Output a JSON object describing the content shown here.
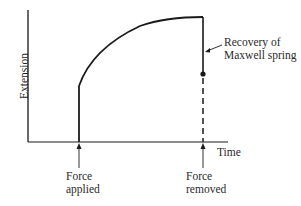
{
  "diagram": {
    "type": "creep-recovery",
    "axes": {
      "ylabel": "Extension",
      "xlabel": "Time"
    },
    "annotations": {
      "force_applied": [
        "Force",
        "applied"
      ],
      "force_removed": [
        "Force",
        "removed"
      ],
      "recovery": [
        "Recovery of",
        "Maxwell spring"
      ]
    },
    "colors": {
      "line": "#1a1a1a",
      "background": "#ffffff"
    }
  }
}
